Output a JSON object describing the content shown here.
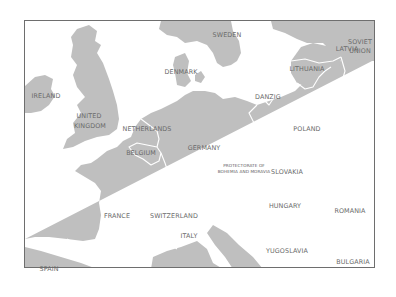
{
  "map": {
    "colors": {
      "land": "#bfbfbf",
      "water": "#ffffff",
      "borders": "#ffffff",
      "frame": "#6e6e6e",
      "label": "#6a6a6a"
    },
    "labels": [
      {
        "id": "sweden",
        "text": "SWEDEN",
        "x": 227,
        "y": 35
      },
      {
        "id": "latvia",
        "text": "LATVIA",
        "x": 347,
        "y": 49
      },
      {
        "id": "soviet-union-1",
        "text": "SOVIET",
        "x": 360,
        "y": 42
      },
      {
        "id": "soviet-union-2",
        "text": "UNION",
        "x": 360,
        "y": 51
      },
      {
        "id": "denmark",
        "text": "DENMARK",
        "x": 181,
        "y": 72
      },
      {
        "id": "lithuania",
        "text": "LITHUANIA",
        "x": 307,
        "y": 69
      },
      {
        "id": "ireland",
        "text": "IRELAND",
        "x": 46,
        "y": 96
      },
      {
        "id": "danzig",
        "text": "DANZIG",
        "x": 268,
        "y": 97
      },
      {
        "id": "united-kingdom-1",
        "text": "UNITED",
        "x": 89,
        "y": 116
      },
      {
        "id": "united-kingdom-2",
        "text": "KINGDOM",
        "x": 90,
        "y": 126
      },
      {
        "id": "netherlands",
        "text": "NETHERLANDS",
        "x": 147,
        "y": 129
      },
      {
        "id": "poland",
        "text": "POLAND",
        "x": 307,
        "y": 129
      },
      {
        "id": "belgium",
        "text": "BELGIUM",
        "x": 141,
        "y": 153
      },
      {
        "id": "germany",
        "text": "GERMANY",
        "x": 204,
        "y": 148
      },
      {
        "id": "protectorate-1",
        "text": "PROTECTORATE OF",
        "x": 244,
        "y": 166
      },
      {
        "id": "protectorate-2",
        "text": "BOHEMIA AND MORAVIA",
        "x": 244,
        "y": 172
      },
      {
        "id": "slovakia",
        "text": "SLOVAKIA",
        "x": 287,
        "y": 172
      },
      {
        "id": "hungary",
        "text": "HUNGARY",
        "x": 285,
        "y": 206
      },
      {
        "id": "romania",
        "text": "ROMANIA",
        "x": 350,
        "y": 211
      },
      {
        "id": "france",
        "text": "FRANCE",
        "x": 117,
        "y": 216
      },
      {
        "id": "switzerland",
        "text": "SWITZERLAND",
        "x": 174,
        "y": 216
      },
      {
        "id": "italy",
        "text": "ITALY",
        "x": 189,
        "y": 236
      },
      {
        "id": "yugoslavia",
        "text": "YUGOSLAVIA",
        "x": 287,
        "y": 251
      },
      {
        "id": "bulgaria",
        "text": "BULGARIA",
        "x": 353,
        "y": 262
      },
      {
        "id": "spain",
        "text": "SPAIN",
        "x": 49,
        "y": 269
      }
    ]
  }
}
